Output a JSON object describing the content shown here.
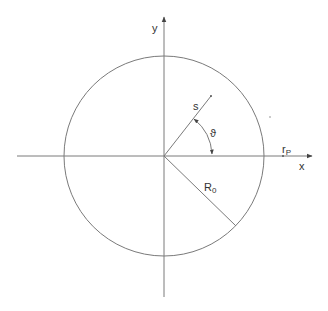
{
  "diagram": {
    "type": "polar-coordinate-circle",
    "colors": {
      "stroke": "#777777",
      "text": "#333333",
      "background": "#ffffff"
    },
    "center": {
      "x": 164,
      "y": 156
    },
    "circle_radius": 100,
    "labels": {
      "y_axis": "y",
      "x_axis": "x",
      "s": "s",
      "theta": "ϑ",
      "r": "r",
      "r_sub": "P",
      "R": "R",
      "R_sub": "0"
    }
  }
}
